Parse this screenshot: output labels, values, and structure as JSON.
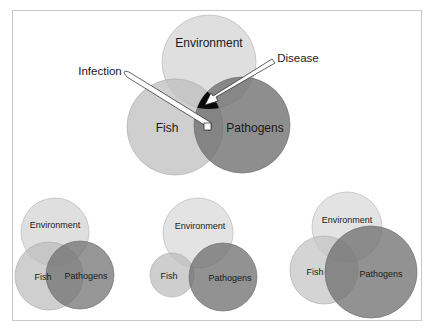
{
  "colors": {
    "environment": "#dcdcdc",
    "fish": "#c4c4c4",
    "pathogens": "#707070",
    "disease": "#0a0a0a",
    "stroke": "#a8a8a8",
    "frame": "#c8c8c8"
  },
  "main_diagram": {
    "circles": [
      {
        "name": "Environment",
        "cx": 209,
        "cy": 62,
        "r": 47
      },
      {
        "name": "Fish",
        "cx": 175,
        "cy": 127,
        "r": 48
      },
      {
        "name": "Pathogens",
        "cx": 242,
        "cy": 125,
        "r": 48
      }
    ],
    "labels": {
      "environment": "Environment",
      "fish": "Fish",
      "pathogens": "Pathogens",
      "infection": "Infection",
      "disease": "Disease"
    },
    "callouts": [
      {
        "label": "Infection",
        "from": [
          125,
          75
        ],
        "to": [
          208,
          128
        ]
      },
      {
        "label": "Disease",
        "from": [
          273,
          62
        ],
        "to": [
          207,
          103
        ]
      }
    ]
  },
  "small_diagrams": [
    {
      "id": "left",
      "circles": [
        {
          "name": "Environment",
          "cx": 55,
          "cy": 232,
          "r": 34
        },
        {
          "name": "Fish",
          "cx": 49,
          "cy": 276,
          "r": 34
        },
        {
          "name": "Pathogens",
          "cx": 80,
          "cy": 275,
          "r": 34
        }
      ],
      "labels": {
        "environment": "Environment",
        "fish": "Fish",
        "pathogens": "Pathogens"
      }
    },
    {
      "id": "middle",
      "circles": [
        {
          "name": "Environment",
          "cx": 198,
          "cy": 233,
          "r": 35
        },
        {
          "name": "Fish",
          "cx": 172,
          "cy": 275,
          "r": 22
        },
        {
          "name": "Pathogens",
          "cx": 223,
          "cy": 277,
          "r": 34
        }
      ],
      "labels": {
        "environment": "Environment",
        "fish": "Fish",
        "pathogens": "Pathogens"
      }
    },
    {
      "id": "right",
      "circles": [
        {
          "name": "Environment",
          "cx": 347,
          "cy": 227,
          "r": 35
        },
        {
          "name": "Fish",
          "cx": 324,
          "cy": 270,
          "r": 34
        },
        {
          "name": "Pathogens",
          "cx": 371,
          "cy": 272,
          "r": 46
        }
      ],
      "labels": {
        "environment": "Environment",
        "fish": "Fish",
        "pathogens": "Pathogens"
      }
    }
  ]
}
